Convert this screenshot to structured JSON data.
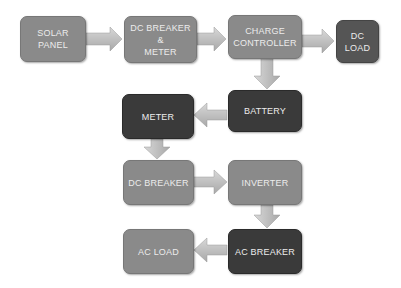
{
  "diagram": {
    "nodes": {
      "solar_panel": "SOLAR\nPANEL",
      "dc_breaker_meter": "DC BREAKER\n&\nMETER",
      "charge_controller": "CHARGE\nCONTROLLER",
      "dc_load": "DC\nLOAD",
      "battery": "BATTERY",
      "meter": "METER",
      "dc_breaker": "DC BREAKER",
      "inverter": "INVERTER",
      "ac_breaker": "AC BREAKER",
      "ac_load": "AC LOAD"
    },
    "edges": [
      {
        "from": "solar_panel",
        "to": "dc_breaker_meter"
      },
      {
        "from": "dc_breaker_meter",
        "to": "charge_controller"
      },
      {
        "from": "charge_controller",
        "to": "dc_load"
      },
      {
        "from": "charge_controller",
        "to": "battery"
      },
      {
        "from": "battery",
        "to": "meter"
      },
      {
        "from": "meter",
        "to": "dc_breaker"
      },
      {
        "from": "dc_breaker",
        "to": "inverter"
      },
      {
        "from": "inverter",
        "to": "ac_breaker"
      },
      {
        "from": "ac_breaker",
        "to": "ac_load"
      }
    ],
    "colors": {
      "light_box": "#8a8a8a",
      "dark_box": "#3a3a3a",
      "arrow": "#c4c4c4",
      "text": "#ececec"
    }
  }
}
